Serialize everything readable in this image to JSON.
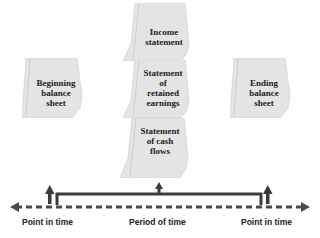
{
  "documents": {
    "beginning_balance_sheet": "Beginning balance sheet",
    "income_statement": "Income statement",
    "retained_earnings": "Statement of retained earnings",
    "cash_flows": "Statement of cash flows",
    "ending_balance_sheet": "Ending balance sheet"
  },
  "doc_lines": {
    "beginning": [
      "Beginning",
      "balance",
      "sheet"
    ],
    "income": [
      "Income",
      "statement"
    ],
    "retained": [
      "Statement",
      "of",
      "retained",
      "earnings"
    ],
    "cash": [
      "Statement",
      "of cash",
      "flows"
    ],
    "ending": [
      "Ending",
      "balance",
      "sheet"
    ]
  },
  "timeline": {
    "left_label": "Point in time",
    "middle_label": "Period of time",
    "right_label": "Point in time"
  },
  "colors": {
    "paper": "#e6e6e6",
    "paper_edge": "#cfcfcf",
    "arrow": "#3a3a3a",
    "dash": "#4a4a4a"
  }
}
